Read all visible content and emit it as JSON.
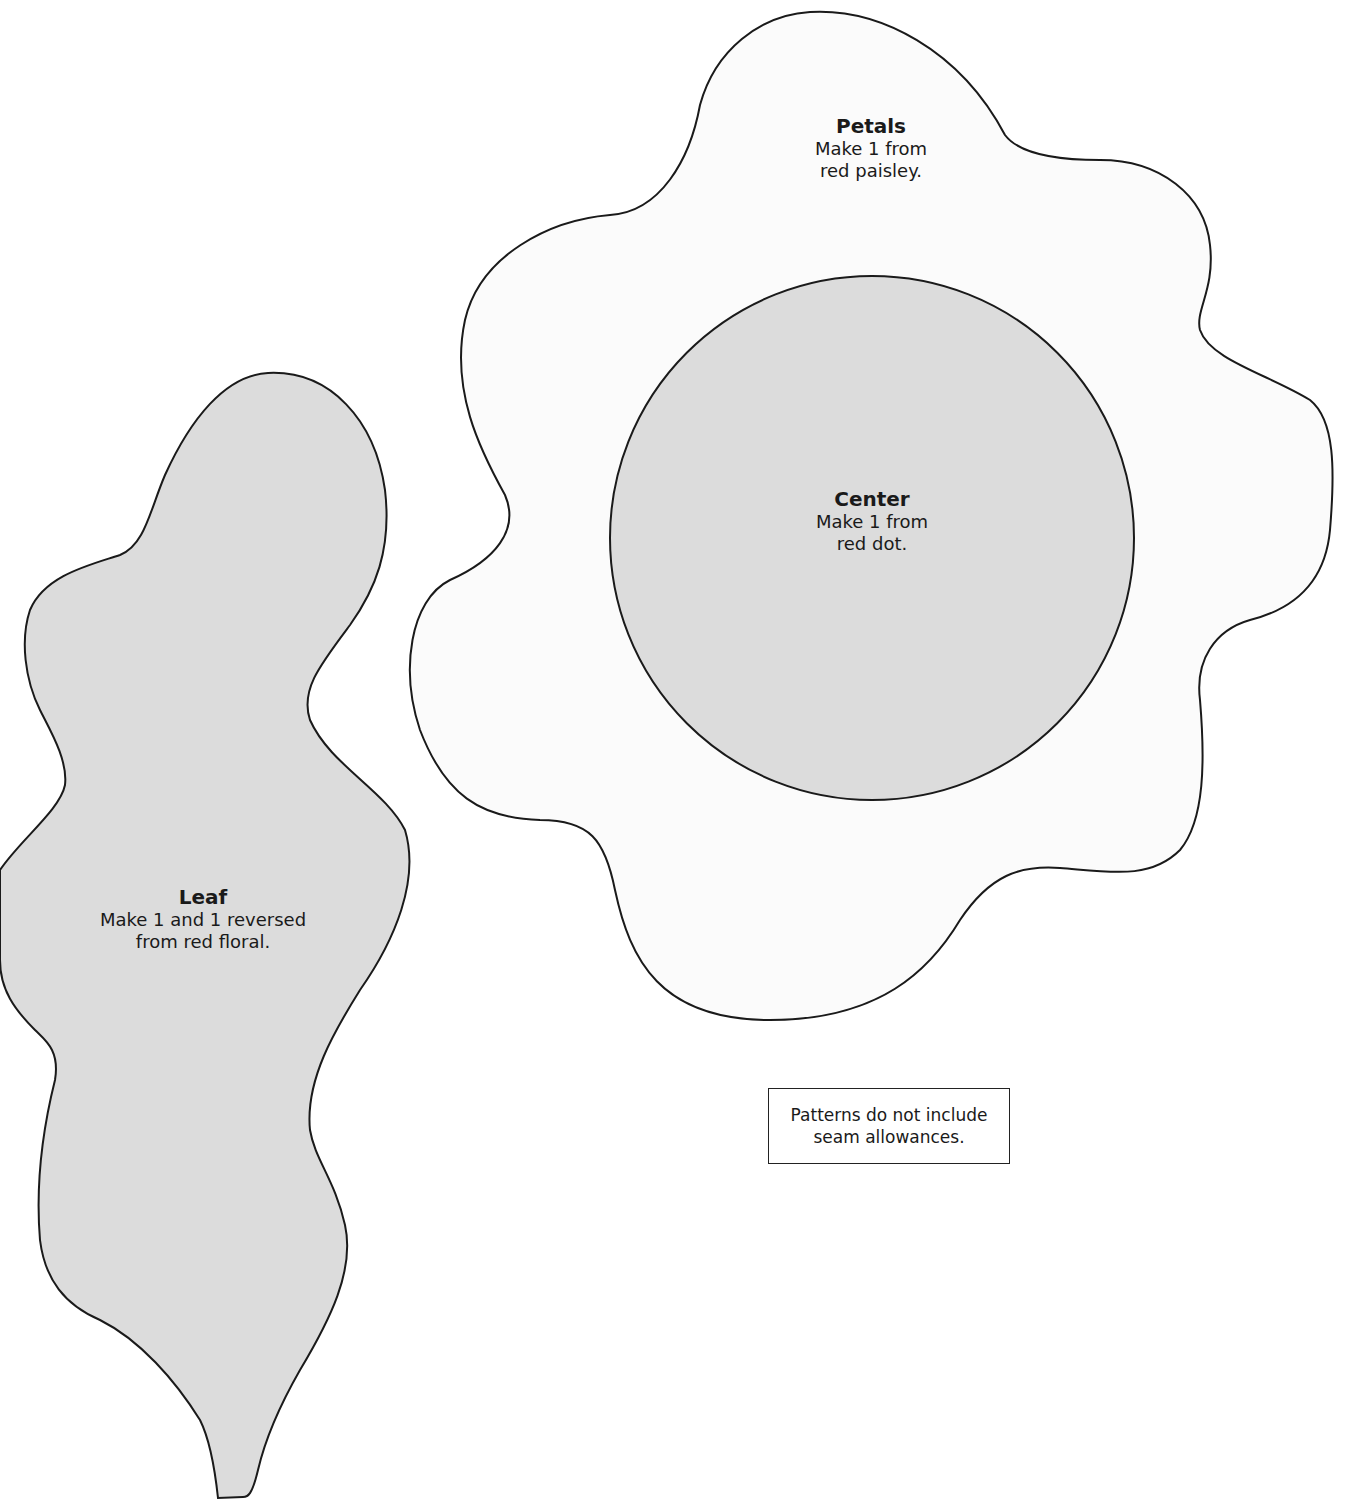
{
  "colors": {
    "petals_fill": "#fbfbfb",
    "center_fill": "#dcdcdc",
    "leaf_fill": "#dcdcdc",
    "outline": "#1a1a1a",
    "background": "#ffffff"
  },
  "pieces": {
    "petals": {
      "title": "Petals",
      "line1": "Make 1 from",
      "line2": "red paisley."
    },
    "center": {
      "title": "Center",
      "line1": "Make 1 from",
      "line2": "red dot."
    },
    "leaf": {
      "title": "Leaf",
      "line1": "Make 1 and 1 reversed",
      "line2": "from red floral."
    }
  },
  "note": {
    "line1": "Patterns do not include",
    "line2": "seam allowances."
  }
}
